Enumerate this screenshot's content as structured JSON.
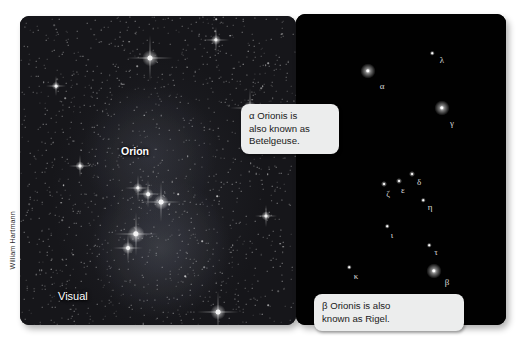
{
  "figure": {
    "credit": "William Hartmann",
    "photo_panel": {
      "name": "orion-photograph",
      "labels": {
        "constellation": "Orion",
        "wavelength": "Visual"
      }
    },
    "chart_panel": {
      "name": "orion-star-chart",
      "stars": [
        {
          "letter": "α",
          "name": "alpha",
          "x": 72,
          "y": 57,
          "mag": 1,
          "lx": 86,
          "ly": 72
        },
        {
          "letter": "λ",
          "name": "lambda",
          "x": 136,
          "y": 39,
          "mag": 3,
          "lx": 146,
          "ly": 46
        },
        {
          "letter": "γ",
          "name": "gamma",
          "x": 146,
          "y": 94,
          "mag": 1,
          "lx": 156,
          "ly": 109
        },
        {
          "letter": "δ",
          "name": "delta",
          "x": 116,
          "y": 160,
          "mag": 2,
          "lx": 123,
          "ly": 168
        },
        {
          "letter": "ε",
          "name": "epsilon",
          "x": 103,
          "y": 167,
          "mag": 2,
          "lx": 107,
          "ly": 176
        },
        {
          "letter": "ζ",
          "name": "zeta",
          "x": 88,
          "y": 170,
          "mag": 2,
          "lx": 92,
          "ly": 180
        },
        {
          "letter": "η",
          "name": "eta",
          "x": 127,
          "y": 186,
          "mag": 3,
          "lx": 134,
          "ly": 193
        },
        {
          "letter": "ι",
          "name": "iota",
          "x": 91,
          "y": 212,
          "mag": 3,
          "lx": 96,
          "ly": 221
        },
        {
          "letter": "τ",
          "name": "tau",
          "x": 133,
          "y": 231,
          "mag": 3,
          "lx": 140,
          "ly": 238
        },
        {
          "letter": "β",
          "name": "beta",
          "x": 138,
          "y": 257,
          "mag": 1,
          "lx": 151,
          "ly": 268
        },
        {
          "letter": "κ",
          "name": "kappa",
          "x": 53,
          "y": 253,
          "mag": 3,
          "lx": 60,
          "ly": 262
        }
      ]
    },
    "callouts": [
      {
        "name": "betelgeuse-callout",
        "text": "α Orionis is\nalso known as\nBetelgeuse."
      },
      {
        "name": "rigel-callout",
        "text": "β Orionis is also\nknown as Rigel."
      }
    ],
    "colors": {
      "page_background": "#ffffff",
      "chart_background": "#010101",
      "photo_background": "#17171b",
      "callout_background": "#eceded",
      "star_color": "#ffffff",
      "label_color": "#d9d9d9"
    }
  }
}
